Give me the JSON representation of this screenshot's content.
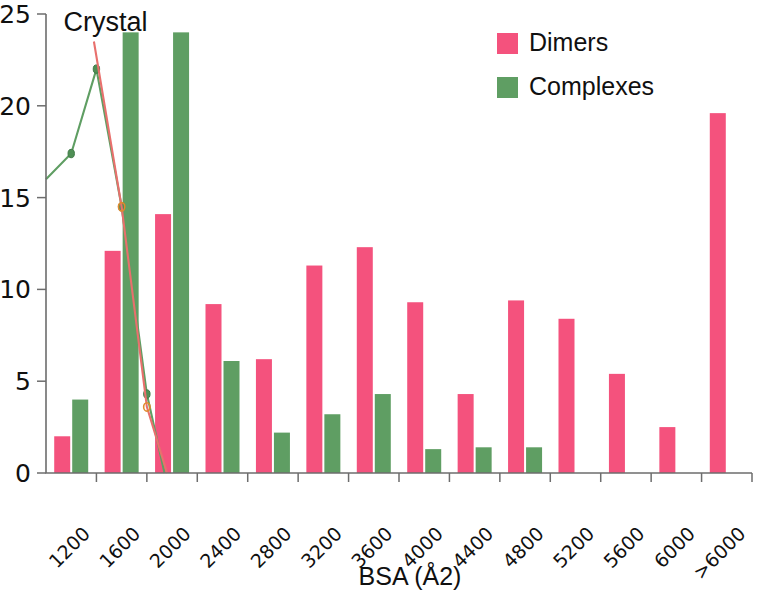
{
  "chart_data": {
    "type": "bar",
    "title": "",
    "xlabel": "BSA (Å2)",
    "ylabel": "",
    "categories": [
      "1200",
      "1600",
      "2000",
      "2400",
      "2800",
      "3200",
      "3600",
      "4000",
      "4400",
      "4800",
      "5200",
      "5600",
      "6000",
      ">6000"
    ],
    "series": [
      {
        "name": "Dimers",
        "color": "#f4527d",
        "values": [
          2.0,
          12.1,
          14.1,
          9.2,
          6.2,
          11.3,
          12.3,
          9.3,
          4.3,
          9.4,
          8.4,
          5.4,
          2.5,
          19.6
        ]
      },
      {
        "name": "Complexes",
        "color": "#5f9e63",
        "values": [
          4.0,
          24.0,
          24.0,
          6.1,
          2.2,
          3.2,
          4.3,
          1.3,
          1.4,
          1.4,
          0,
          0,
          0,
          0
        ]
      }
    ],
    "overlay_lines": [
      {
        "name": "Crystal",
        "color": "#5f9e63",
        "marker_color": "#4f8f55",
        "x_positions": [
          0,
          0.5,
          1.0,
          1.5,
          2.0,
          2.35
        ],
        "values": [
          16.0,
          17.4,
          22.0,
          14.5,
          4.3,
          0.0
        ]
      },
      {
        "name": "Crystal-secondary",
        "color": "#e8706d",
        "marker_color": "#e08a2e",
        "x_positions": [
          0.95,
          1.5,
          2.0,
          2.4
        ],
        "values": [
          23.5,
          14.5,
          3.6,
          0.0
        ]
      }
    ],
    "ylim": [
      0,
      25
    ],
    "yticks": [
      0,
      5,
      10,
      15,
      20,
      25
    ],
    "ytick_labels": [
      "0",
      "5",
      "10",
      "15",
      "20",
      "25"
    ],
    "grid": false,
    "legend_position": "top-right",
    "annotations": [
      {
        "text": "Crystal",
        "x": 0.35,
        "y": 24.1
      }
    ]
  },
  "legend": {
    "items": [
      {
        "label": "Dimers",
        "color": "#f4527d"
      },
      {
        "label": "Complexes",
        "color": "#5f9e63"
      }
    ]
  }
}
